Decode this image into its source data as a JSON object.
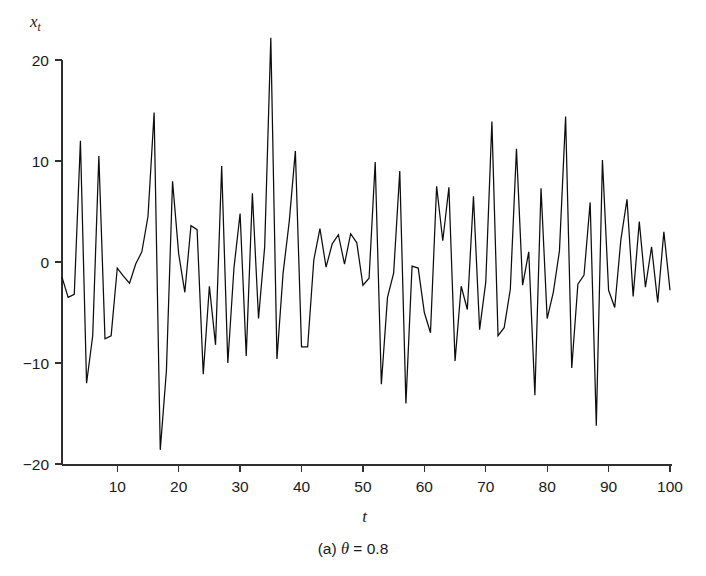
{
  "figure": {
    "caption_prefix": "(a)",
    "caption_symbol": "θ",
    "caption_relation": "=",
    "caption_value": "0.8",
    "caption_full": "(a) θ = 0.8",
    "line_color": "#0d0d0d",
    "axis_color": "#303030",
    "background_color": "#ffffff"
  },
  "chart_data": {
    "type": "line",
    "title": "",
    "subtitle": "",
    "xlabel": "t",
    "ylabel": "x_t",
    "ylabel_base": "x",
    "ylabel_sub": "t",
    "xlim": [
      1,
      100
    ],
    "ylim": [
      -20,
      22.5
    ],
    "grid": false,
    "legend": null,
    "legend_position": "none",
    "xticks": [
      10,
      20,
      30,
      40,
      50,
      60,
      70,
      80,
      90,
      100
    ],
    "xtick_labels": [
      "10",
      "20",
      "30",
      "40",
      "50",
      "60",
      "70",
      "80",
      "90",
      "100"
    ],
    "yticks": [
      -20,
      -10,
      0,
      10,
      20
    ],
    "ytick_labels": [
      "-20",
      "-10",
      "0",
      "10",
      "20"
    ],
    "x": [
      1,
      2,
      3,
      4,
      5,
      6,
      7,
      8,
      9,
      10,
      11,
      12,
      13,
      14,
      15,
      16,
      17,
      18,
      19,
      20,
      21,
      22,
      23,
      24,
      25,
      26,
      27,
      28,
      29,
      30,
      31,
      32,
      33,
      34,
      35,
      36,
      37,
      38,
      39,
      40,
      41,
      42,
      43,
      44,
      45,
      46,
      47,
      48,
      49,
      50,
      51,
      52,
      53,
      54,
      55,
      56,
      57,
      58,
      59,
      60,
      61,
      62,
      63,
      64,
      65,
      66,
      67,
      68,
      69,
      70,
      71,
      72,
      73,
      74,
      75,
      76,
      77,
      78,
      79,
      80,
      81,
      82,
      83,
      84,
      85,
      86,
      87,
      88,
      89,
      90,
      91,
      92,
      93,
      94,
      95,
      96,
      97,
      98,
      99,
      100
    ],
    "values": [
      -1.5,
      -3.5,
      -3.2,
      12.0,
      -12.0,
      -7.3,
      10.5,
      -7.6,
      -7.3,
      -0.6,
      -1.4,
      -2.1,
      -0.2,
      1.0,
      4.5,
      14.8,
      -18.6,
      -10.8,
      8.0,
      0.8,
      -3.0,
      3.6,
      3.2,
      -11.1,
      -2.4,
      -8.2,
      9.5,
      -10.0,
      -0.6,
      4.8,
      -9.3,
      6.8,
      -5.6,
      1.5,
      22.2,
      -9.6,
      -1.1,
      4.0,
      11.0,
      -8.4,
      -8.4,
      0.2,
      3.3,
      -0.5,
      1.8,
      2.7,
      -0.2,
      2.8,
      1.9,
      -2.3,
      -1.6,
      9.9,
      -12.1,
      -3.5,
      -1.1,
      9.0,
      -14.0,
      -0.4,
      -0.6,
      -5.0,
      -7.0,
      7.5,
      2.1,
      7.4,
      -9.8,
      -2.4,
      -4.7,
      6.5,
      -6.7,
      -2.0,
      13.9,
      -7.3,
      -6.5,
      -2.7,
      11.2,
      -2.3,
      1.0,
      -13.2,
      7.3,
      -5.6,
      -3.0,
      1.1,
      14.4,
      -10.5,
      -2.2,
      -1.3,
      5.9,
      -16.2,
      10.1,
      -2.8,
      -4.5,
      2.2,
      6.2,
      -3.4,
      4.0,
      -2.5,
      1.5,
      -4.0,
      3.0,
      -2.8
    ]
  }
}
